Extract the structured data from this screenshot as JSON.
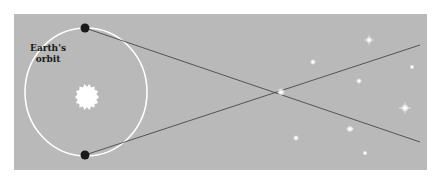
{
  "diagram": {
    "label_line1": "Earth's",
    "label_line2": "orbit",
    "colors": {
      "background": "#ffffff",
      "panel": "#b9b9b9",
      "orbit": "#ffffff",
      "earth": "#1a1a1a",
      "sight_lines": "#3a3a3a",
      "sun": "#ffffff",
      "stars": "#ffffff"
    },
    "orbit": {
      "cx": 86,
      "cy": 92,
      "rx": 61,
      "ry": 64
    },
    "sun": {
      "cx": 87,
      "cy": 97,
      "r": 12
    },
    "earth_positions": [
      {
        "x": 85,
        "y": 28
      },
      {
        "x": 85,
        "y": 155
      }
    ],
    "near_star": {
      "x": 281,
      "y": 92
    },
    "sight_line_ends": [
      {
        "x": 420,
        "y": 45
      },
      {
        "x": 420,
        "y": 142
      }
    ],
    "background_stars": [
      {
        "x": 369,
        "y": 40,
        "size": 3
      },
      {
        "x": 313,
        "y": 62,
        "size": 2.5
      },
      {
        "x": 412,
        "y": 67,
        "size": 2
      },
      {
        "x": 359,
        "y": 81,
        "size": 2.5
      },
      {
        "x": 405,
        "y": 108,
        "size": 3.5
      },
      {
        "x": 350,
        "y": 129,
        "size": 3
      },
      {
        "x": 296,
        "y": 138,
        "size": 2.5
      },
      {
        "x": 365,
        "y": 153,
        "size": 2
      }
    ]
  }
}
